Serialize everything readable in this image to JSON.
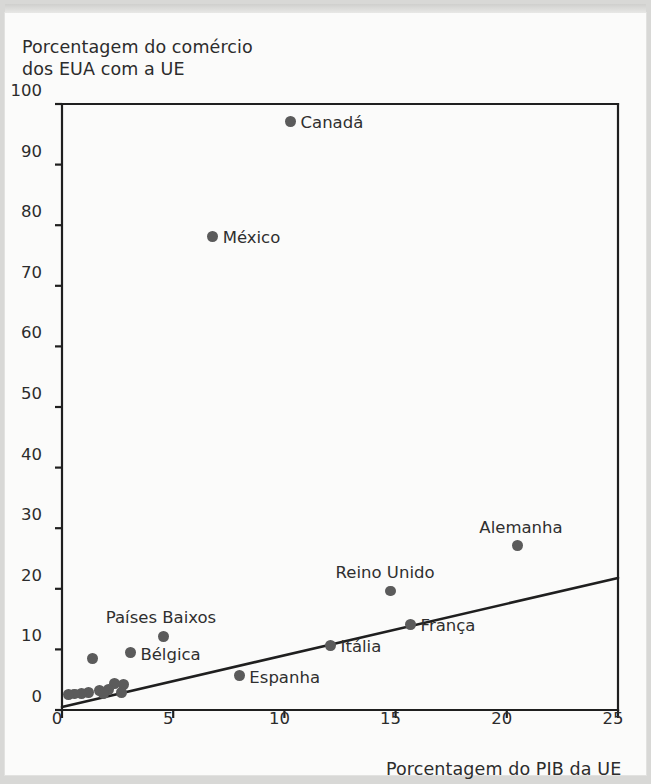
{
  "chart_data": {
    "type": "scatter",
    "title": "",
    "ylabel": "Porcentagem do comércio\ndos EUA com a UE",
    "xlabel": "Porcentagem do PIB da UE",
    "xlim": [
      0,
      25
    ],
    "ylim": [
      0,
      100
    ],
    "xticks": [
      0,
      5,
      10,
      15,
      20,
      25
    ],
    "yticks": [
      0,
      10,
      20,
      30,
      40,
      50,
      60,
      70,
      80,
      90,
      100
    ],
    "grid": false,
    "legend": "none",
    "point_color": "#5b5b5b",
    "line_color": "#1f1f1f",
    "points": [
      {
        "label": "Canadá",
        "x": 10.5,
        "y": 95.0,
        "label_dx": 10,
        "label_dy": -6
      },
      {
        "label": "México",
        "x": 7.0,
        "y": 76.0,
        "label_dx": 10,
        "label_dy": -6
      },
      {
        "label": "Alemanha",
        "x": 20.7,
        "y": 25.0,
        "label_dx": -38,
        "label_dy": -26
      },
      {
        "label": "Reino Unido",
        "x": 15.0,
        "y": 17.5,
        "label_dx": -55,
        "label_dy": -26
      },
      {
        "label": "França",
        "x": 15.9,
        "y": 12.0,
        "label_dx": 10,
        "label_dy": -6
      },
      {
        "label": "Países Baixos",
        "x": 4.8,
        "y": 10.0,
        "label_dx": -58,
        "label_dy": -26
      },
      {
        "label": "Itália",
        "x": 12.3,
        "y": 8.5,
        "label_dx": 10,
        "label_dy": -6
      },
      {
        "label": "Bélgica",
        "x": 3.3,
        "y": 7.3,
        "label_dx": 10,
        "label_dy": -6
      },
      {
        "label": "Espanha",
        "x": 8.2,
        "y": 3.5,
        "label_dx": 10,
        "label_dy": -6
      },
      {
        "label": "",
        "x": 1.6,
        "y": 6.3
      },
      {
        "label": "",
        "x": 2.6,
        "y": 2.2
      },
      {
        "label": "",
        "x": 3.0,
        "y": 2.0
      },
      {
        "label": "",
        "x": 2.3,
        "y": 1.3
      },
      {
        "label": "",
        "x": 2.9,
        "y": 0.8
      },
      {
        "label": "",
        "x": 1.9,
        "y": 1.1
      },
      {
        "label": "",
        "x": 1.4,
        "y": 0.8
      },
      {
        "label": "",
        "x": 1.1,
        "y": 0.6
      },
      {
        "label": "",
        "x": 0.8,
        "y": 0.5
      },
      {
        "label": "",
        "x": 0.5,
        "y": 0.4
      },
      {
        "label": "",
        "x": 2.1,
        "y": 0.5
      }
    ],
    "trendline": {
      "x0": 0,
      "y0": 0.5,
      "x1": 25,
      "y1": 21.8
    }
  }
}
